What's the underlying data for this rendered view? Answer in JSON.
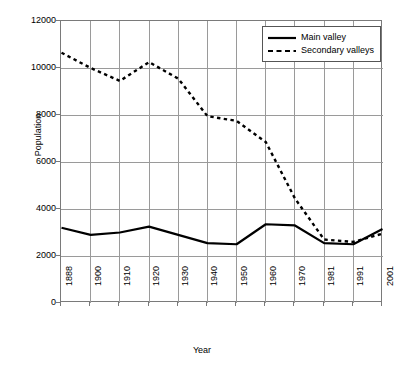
{
  "chart_data": {
    "type": "line",
    "title": "",
    "xlabel": "Year",
    "ylabel": "Population",
    "categories": [
      "1888",
      "1900",
      "1910",
      "1920",
      "1930",
      "1940",
      "1950",
      "1960",
      "1970",
      "1981",
      "1991",
      "2001"
    ],
    "series": [
      {
        "name": "Main valley",
        "style": "solid",
        "color": "#000000",
        "values": [
          3200,
          2900,
          3000,
          3250,
          2900,
          2550,
          2500,
          3350,
          3300,
          2550,
          2500,
          3150
        ]
      },
      {
        "name": "Secondary valleys",
        "style": "dashed",
        "color": "#000000",
        "values": [
          10650,
          10000,
          9450,
          10250,
          9550,
          7950,
          7750,
          6850,
          4450,
          2700,
          2600,
          2950
        ]
      }
    ],
    "ylim": [
      0,
      12000
    ],
    "y_ticks": [
      "0",
      "2000",
      "4000",
      "6000",
      "8000",
      "10000",
      "12000"
    ],
    "grid": "both",
    "legend_position": "top-right",
    "legend_entries": [
      "Main valley",
      "Secondary valleys"
    ]
  },
  "axes": {
    "y_label": "Population",
    "x_label": "Year"
  },
  "colors": {
    "grid": "#9a9a9a",
    "frame": "#7a7a7a",
    "line": "#000000",
    "background": "#ffffff"
  }
}
